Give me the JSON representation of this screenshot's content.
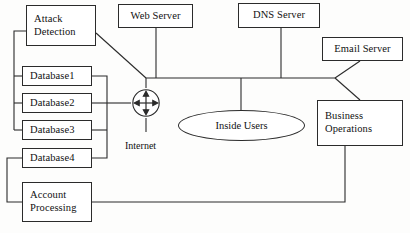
{
  "diagram": {
    "type": "network-topology",
    "canvas": {
      "width": 410,
      "height": 233
    },
    "style": {
      "background": "#fdfdfc",
      "line_color": "#2b2b2b",
      "node_fill": "#ffffff",
      "text_color": "#111111"
    },
    "nodes": {
      "attack_detection": {
        "label_line1": "Attack",
        "label_line2": "Detection"
      },
      "web_server": {
        "label": "Web Server"
      },
      "dns_server": {
        "label": "DNS Server"
      },
      "email_server": {
        "label": "Email Server"
      },
      "database1": {
        "label": "Database1"
      },
      "database2": {
        "label": "Database2"
      },
      "database3": {
        "label": "Database3"
      },
      "database4": {
        "label": "Database4"
      },
      "account_processing": {
        "label_line1": "Account",
        "label_line2": "Processing"
      },
      "business_operations": {
        "label_line1": "Business",
        "label_line2": "Operations"
      },
      "inside_users": {
        "label": "Inside Users"
      },
      "internet_router": {
        "label": "Internet",
        "icon": "router-four-way-arrow-icon"
      }
    }
  }
}
